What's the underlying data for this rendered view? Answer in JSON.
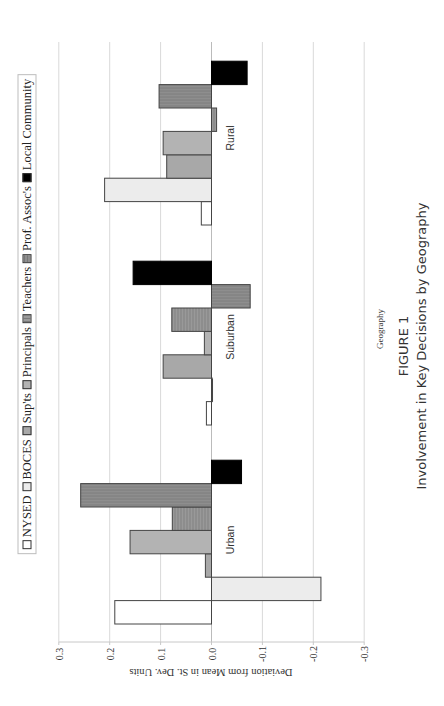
{
  "chart_data": {
    "type": "bar",
    "orientation": "rotated-90 (value axis horizontal, positive to the left)",
    "title": "FIGURE 1",
    "subtitle": "Involvement in Key Decisions by Geography",
    "xlabel": "Geography",
    "ylabel": "Deviation from Mean in St. Dev. Units",
    "ylim": [
      -0.3,
      0.3
    ],
    "yticks": [
      "0.3",
      "0.2",
      "0.1",
      "0.0",
      "-0.1",
      "-0.2",
      "-0.3"
    ],
    "grid": true,
    "legend_position": "top",
    "categories": [
      "Urban",
      "Suburban",
      "Rural"
    ],
    "series": [
      {
        "name": "NYSED",
        "color": "#ffffff",
        "values": [
          0.19,
          0.01,
          0.02
        ]
      },
      {
        "name": "BOCES",
        "color": "#ececec",
        "values": [
          -0.215,
          -0.002,
          0.21
        ]
      },
      {
        "name": "Sup'ts",
        "color": "#a8a8a8",
        "values": [
          0.012,
          0.095,
          0.088
        ]
      },
      {
        "name": "Principals",
        "color": "#b3b3b3",
        "values": [
          0.16,
          0.014,
          0.095
        ]
      },
      {
        "name": "Teachers",
        "color": "#969696",
        "values": [
          0.077,
          0.078,
          -0.01
        ]
      },
      {
        "name": "Prof. Assoc's",
        "color": "#8a8a8a",
        "values": [
          0.257,
          -0.076,
          0.103
        ]
      },
      {
        "name": "Local Community",
        "color": "#000000",
        "values": [
          -0.059,
          0.154,
          -0.07
        ]
      }
    ]
  },
  "legend": {
    "items": [
      "NYSED",
      "BOCES",
      "Sup'ts",
      "Principals",
      "Teachers",
      "Prof. Assoc's",
      "Local Community"
    ]
  },
  "axis": {
    "title": "Deviation from Mean in St. Dev. Units",
    "category_title": "Geography"
  },
  "caption": {
    "figure": "FIGURE 1",
    "title": "Involvement in Key Decisions by Geography"
  }
}
